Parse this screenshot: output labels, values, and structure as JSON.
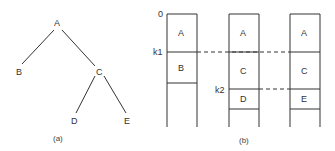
{
  "tree": {
    "nodes": {
      "A": "A",
      "B": "B",
      "C": "C",
      "D": "D",
      "E": "E"
    },
    "edges": [
      [
        "A",
        "B"
      ],
      [
        "A",
        "C"
      ],
      [
        "C",
        "D"
      ],
      [
        "C",
        "E"
      ]
    ],
    "caption": "(a)"
  },
  "stacks": {
    "markers": {
      "zero": "0",
      "k1": "k1",
      "k2": "k2"
    },
    "columns": [
      {
        "cells": [
          "A",
          "B"
        ]
      },
      {
        "cells": [
          "A",
          "C",
          "D"
        ]
      },
      {
        "cells": [
          "A",
          "C",
          "E"
        ]
      }
    ],
    "caption": "(b)"
  }
}
